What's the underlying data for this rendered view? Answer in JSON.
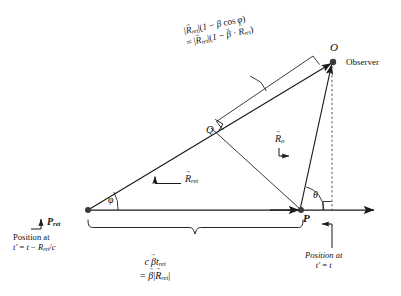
{
  "figure": {
    "background_color": "#ffffff",
    "stroke_color": "#1a1a1a"
  },
  "points": {
    "P_ret": {
      "label": "P",
      "subscript": "ret",
      "x": 88,
      "y": 210
    },
    "P": {
      "label": "P",
      "x": 300,
      "y": 210
    },
    "O": {
      "label": "O",
      "x": 332,
      "y": 62
    },
    "Q": {
      "label": "Q",
      "x": 212,
      "y": 132
    }
  },
  "labels": {
    "observer": "Observer",
    "point_O": "O",
    "point_Q": "Q",
    "point_P": "P",
    "point_P_ret_base": "P",
    "point_P_ret_sub": "ret",
    "angle_phi": "φ",
    "angle_theta": "θ"
  },
  "vectors": {
    "R_ret": {
      "base": "R",
      "subscript": "ret",
      "accent": "vector"
    },
    "R_o": {
      "base": "R",
      "subscript": "o",
      "accent": "vector"
    }
  },
  "annotations": {
    "top_formula": {
      "line1": {
        "open": "|",
        "vec": "R",
        "sub": "ret",
        "close": "|(1 − ",
        "beta": "β",
        "cos": " cos",
        "phi": "φ",
        "end": ")"
      },
      "line1_text": "|R⃗ret|(1 − β cosφ)",
      "line2_text": "= |R⃗ret|(1 − β⃗ · R̂ret)"
    },
    "bottom_brace_formula": {
      "line1_text": "c β⃗ tret",
      "line2_text": "= β⃗ |R⃗ret|"
    },
    "position_left": {
      "line1": "Position at",
      "line2_text": "t′ = t − Rret/c"
    },
    "position_right": {
      "line1": "Position at",
      "line2_text": "t′ = t"
    }
  },
  "symbols": {
    "c": "c",
    "t_prime": "t′",
    "equals": "=",
    "minus": "−",
    "t": "t",
    "slash_c": "/c",
    "beta": "β",
    "R": "R",
    "sub_ret": "ret",
    "sub_o": "o",
    "dot": "·",
    "paren_open": "(",
    "paren_close": ")",
    "one": "1",
    "cos": "cos",
    "bar": "|",
    "position_at": "Position at"
  }
}
